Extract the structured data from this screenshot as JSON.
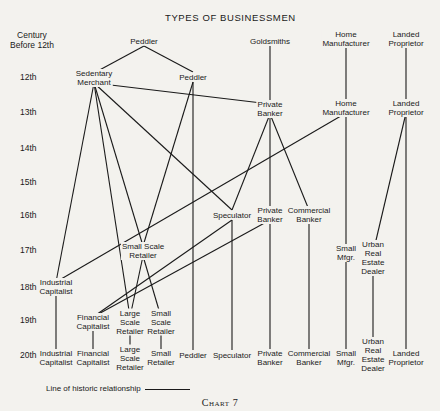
{
  "title": "TYPES OF BUSINESSMEN",
  "caption": "Chart 7",
  "legend": {
    "label": "Line of historic relationship"
  },
  "rows": [
    {
      "label": "Century Before 12th",
      "y": 40
    },
    {
      "label": "12th",
      "y": 77
    },
    {
      "label": "13th",
      "y": 112
    },
    {
      "label": "14th",
      "y": 148
    },
    {
      "label": "15th",
      "y": 182
    },
    {
      "label": "16th",
      "y": 215
    },
    {
      "label": "17th",
      "y": 250
    },
    {
      "label": "18th",
      "y": 287
    },
    {
      "label": "19th",
      "y": 320
    },
    {
      "label": "20th",
      "y": 355
    }
  ],
  "nodes": {
    "peddler_pre": {
      "label": "Peddler",
      "x": 144,
      "y": 41
    },
    "goldsmiths": {
      "label": "Goldsmiths",
      "x": 270,
      "y": 41
    },
    "home_mfr_pre": {
      "label": "Home Manufacturer",
      "x": 346,
      "y": 39
    },
    "landed_pre": {
      "label": "Landed Proprietor",
      "x": 406,
      "y": 39
    },
    "sedentary_12": {
      "label": "Sedentary Merchant",
      "x": 94,
      "y": 78
    },
    "peddler_12": {
      "label": "Peddler",
      "x": 193,
      "y": 77
    },
    "private_banker_13": {
      "label": "Private Banker",
      "x": 270,
      "y": 109
    },
    "home_mfr_13": {
      "label": "Home Manufacturer",
      "x": 346,
      "y": 108
    },
    "landed_13": {
      "label": "Landed Proprietor",
      "x": 406,
      "y": 108
    },
    "speculator_16": {
      "label": "Speculator",
      "x": 232,
      "y": 215
    },
    "private_banker_16": {
      "label": "Private Banker",
      "x": 270,
      "y": 215
    },
    "commercial_banker_16": {
      "label": "Commercial Banker",
      "x": 309,
      "y": 215
    },
    "small_scale_retailer_17": {
      "label": "Small Scale Retailer",
      "x": 143,
      "y": 251
    },
    "small_mfgr_17": {
      "label": "Small Mfgr.",
      "x": 346,
      "y": 253
    },
    "urban_re_17": {
      "label": "Urban Real Estate Dealer",
      "x": 373,
      "y": 258
    },
    "industrial_cap_18": {
      "label": "Industrial Capitalist",
      "x": 56,
      "y": 287
    },
    "financial_cap_19": {
      "label": "Financial Capitalist",
      "x": 93,
      "y": 322
    },
    "large_retailer_19": {
      "label": "Large Scale Retailer",
      "x": 130,
      "y": 322
    },
    "small_retailer_19": {
      "label": "Small Scale Retailer",
      "x": 161,
      "y": 322
    },
    "industrial_cap_20": {
      "label": "Industrial Capitalist",
      "x": 56,
      "y": 358
    },
    "financial_cap_20": {
      "label": "Financial Capitalist",
      "x": 93,
      "y": 358
    },
    "large_retailer_20": {
      "label": "Large Scale Retailer",
      "x": 130,
      "y": 358
    },
    "small_retailer_20": {
      "label": "Small Retailer",
      "x": 161,
      "y": 358
    },
    "peddler_20": {
      "label": "Peddler",
      "x": 193,
      "y": 355
    },
    "speculator_20": {
      "label": "Speculator",
      "x": 232,
      "y": 355
    },
    "private_banker_20": {
      "label": "Private Banker",
      "x": 270,
      "y": 358
    },
    "commercial_banker_20": {
      "label": "Commercial Banker",
      "x": 309,
      "y": 358
    },
    "small_mfgr_20": {
      "label": "Small Mfgr.",
      "x": 346,
      "y": 358
    },
    "urban_re_20": {
      "label": "Urban Real Estate Dealer",
      "x": 373,
      "y": 355
    },
    "landed_20": {
      "label": "Landed Proprietor",
      "x": 406,
      "y": 358
    }
  },
  "edges": [
    [
      "peddler_pre",
      "sedentary_12"
    ],
    [
      "peddler_pre",
      "peddler_12"
    ],
    [
      "goldsmiths",
      "private_banker_13"
    ],
    [
      "home_mfr_pre",
      "home_mfr_13"
    ],
    [
      "landed_pre",
      "landed_13"
    ],
    [
      "sedentary_12",
      "private_banker_13"
    ],
    [
      "sedentary_12",
      "industrial_cap_18"
    ],
    [
      "sedentary_12",
      "large_retailer_19"
    ],
    [
      "sedentary_12",
      "speculator_16"
    ],
    [
      "sedentary_12",
      "small_scale_retailer_17"
    ],
    [
      "peddler_12",
      "small_scale_retailer_17"
    ],
    [
      "peddler_12",
      "peddler_20"
    ],
    [
      "private_banker_13",
      "speculator_16"
    ],
    [
      "private_banker_13",
      "private_banker_16"
    ],
    [
      "private_banker_13",
      "commercial_banker_16"
    ],
    [
      "home_mfr_13",
      "industrial_cap_18"
    ],
    [
      "home_mfr_13",
      "small_mfgr_17"
    ],
    [
      "landed_13",
      "urban_re_17"
    ],
    [
      "landed_13",
      "landed_20"
    ],
    [
      "speculator_16",
      "financial_cap_19"
    ],
    [
      "speculator_16",
      "speculator_20"
    ],
    [
      "private_banker_16",
      "financial_cap_19"
    ],
    [
      "private_banker_16",
      "private_banker_20"
    ],
    [
      "commercial_banker_16",
      "commercial_banker_20"
    ],
    [
      "small_scale_retailer_17",
      "large_retailer_19"
    ],
    [
      "small_scale_retailer_17",
      "small_retailer_19"
    ],
    [
      "small_mfgr_17",
      "small_mfgr_20"
    ],
    [
      "urban_re_17",
      "urban_re_20"
    ],
    [
      "industrial_cap_18",
      "industrial_cap_20"
    ],
    [
      "financial_cap_19",
      "financial_cap_20"
    ],
    [
      "large_retailer_19",
      "large_retailer_20"
    ],
    [
      "small_retailer_19",
      "small_retailer_20"
    ]
  ]
}
